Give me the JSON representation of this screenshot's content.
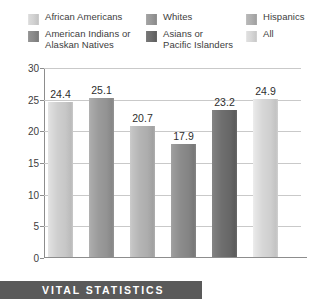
{
  "chart_data": {
    "type": "bar",
    "title": "",
    "xlabel": "",
    "ylabel": "",
    "ylim": [
      0,
      30
    ],
    "ytick_step": 5,
    "yticks": [
      "0",
      "5",
      "10",
      "15",
      "20",
      "25",
      "30"
    ],
    "grid": true,
    "legend_position": "top",
    "categories": [
      "African Americans",
      "Whites",
      "Hispanics",
      "American Indians or\nAlaskan Natives",
      "Asians or\nPacific Islanders",
      "All"
    ],
    "values": [
      24.4,
      25.1,
      20.7,
      17.9,
      23.2,
      24.9
    ],
    "value_labels": [
      "24.4",
      "25.1",
      "20.7",
      "17.9",
      "23.2",
      "24.9"
    ],
    "bar_colors": [
      "#cfcfcf",
      "#9b9b9b",
      "#b5b5b5",
      "#8c8c8c",
      "#6f6f6f",
      "#d7d7d7"
    ]
  },
  "legend": {
    "items": [
      {
        "label": "African Americans",
        "color": "#d3d3d3"
      },
      {
        "label": "Whites",
        "color": "#9a9a9a"
      },
      {
        "label": "Hispanics",
        "color": "#b0b0b0"
      },
      {
        "label": "American Indians or\nAlaskan Natives",
        "color": "#8b8b8b"
      },
      {
        "label": "Asians or\nPacific Islanders",
        "color": "#6e6e6e"
      },
      {
        "label": "All",
        "color": "#d8d8d8"
      }
    ]
  },
  "banner": {
    "text": "VITAL STATISTICS",
    "background": "#5a5a5a",
    "text_color": "#ffffff"
  }
}
